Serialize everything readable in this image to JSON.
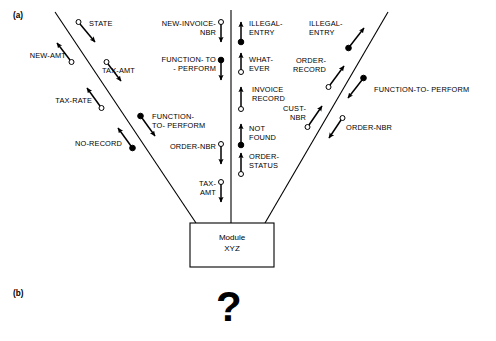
{
  "figure": {
    "part_a_label": "(a)",
    "part_b_label": "(b)",
    "part_b_symbol": "?",
    "module": {
      "line1": "Module",
      "line2": "XYZ"
    },
    "colors": {
      "stroke": "#000000",
      "fill_solid": "#000000",
      "fill_hollow": "#ffffff",
      "background": "#ffffff"
    }
  },
  "flows": {
    "left_branch": [
      {
        "name": "STATE",
        "label": "STATE",
        "direction": "down",
        "marker": "hollow"
      },
      {
        "name": "NEW-AMT",
        "label": "NEW-AMT",
        "direction": "up",
        "marker": "hollow"
      },
      {
        "name": "TAX-AMT",
        "label": "TAX-AMT",
        "direction": "down",
        "marker": "hollow"
      },
      {
        "name": "TAX-RATE",
        "label": "TAX-RATE",
        "direction": "up",
        "marker": "hollow"
      },
      {
        "name": "FUNCTION-TO-PERFORM",
        "label": "FUNCTION-\nTO- PERFORM",
        "direction": "down",
        "marker": "solid"
      },
      {
        "name": "NO-RECORD",
        "label": "NO-RECORD",
        "direction": "up",
        "marker": "solid"
      }
    ],
    "center_left_column": [
      {
        "name": "NEW-INVOICE-NBR",
        "label": "NEW-INVOICE-\nNBR",
        "direction": "down",
        "marker": "hollow"
      },
      {
        "name": "FUNCTION-TO-PERFORM",
        "label": "FUNCTION- TO\n- PERFORM",
        "direction": "down",
        "marker": "solid"
      },
      {
        "name": "ORDER-NBR",
        "label": "ORDER-NBR",
        "direction": "down",
        "marker": "hollow"
      },
      {
        "name": "TAX-AMT",
        "label": "TAX-\nAMT",
        "direction": "down",
        "marker": "hollow"
      }
    ],
    "center_right_column": [
      {
        "name": "ILLEGAL-ENTRY",
        "label": "ILLEGAL-\nENTRY",
        "direction": "up",
        "marker": "solid"
      },
      {
        "name": "WHAT-EVER",
        "label": "WHAT-\nEVER",
        "direction": "up",
        "marker": "hollow"
      },
      {
        "name": "INVOICE-RECORD",
        "label": "INVOICE\nRECORD",
        "direction": "up",
        "marker": "hollow"
      },
      {
        "name": "NOT-FOUND",
        "label": "NOT\nFOUND",
        "direction": "up",
        "marker": "solid"
      },
      {
        "name": "ORDER-STATUS",
        "label": "ORDER-\nSTATUS",
        "direction": "up",
        "marker": "hollow"
      }
    ],
    "right_branch": [
      {
        "name": "ILLEGAL-ENTRY",
        "label": "ILLEGAL-\nENTRY",
        "direction": "up",
        "marker": "solid"
      },
      {
        "name": "ORDER-RECORD",
        "label": "ORDER-\nRECORD",
        "direction": "up",
        "marker": "hollow"
      },
      {
        "name": "FUNCTION-TO-PERFORM",
        "label": "FUNCTION-TO- PERFORM",
        "direction": "down",
        "marker": "solid"
      },
      {
        "name": "CUST-NBR",
        "label": "CUST-\nNBR",
        "direction": "up",
        "marker": "hollow"
      },
      {
        "name": "ORDER-NBR",
        "label": "ORDER-NBR",
        "direction": "down",
        "marker": "hollow"
      }
    ]
  },
  "labels": {
    "state": "STATE",
    "new_amt": "NEW-AMT",
    "tax_amt_left": "TAX-AMT",
    "tax_rate": "TAX-RATE",
    "function_to_perform_left": "FUNCTION-\nTO- PERFORM",
    "no_record": "NO-RECORD",
    "new_invoice_nbr": "NEW-INVOICE-\nNBR",
    "function_to_perform_cl": "FUNCTION- TO\n- PERFORM",
    "order_nbr_cl": "ORDER-NBR",
    "tax_amt_cl": "TAX-\nAMT",
    "illegal_entry_c": "ILLEGAL-\nENTRY",
    "what_ever": "WHAT-\nEVER",
    "invoice_record": "INVOICE\nRECORD",
    "not_found": "NOT\nFOUND",
    "order_status": "ORDER-\nSTATUS",
    "illegal_entry_r": "ILLEGAL-\nENTRY",
    "order_record": "ORDER-\nRECORD",
    "function_to_perform_right": "FUNCTION-TO- PERFORM",
    "cust_nbr": "CUST-\nNBR",
    "order_nbr_r": "ORDER-NBR"
  }
}
